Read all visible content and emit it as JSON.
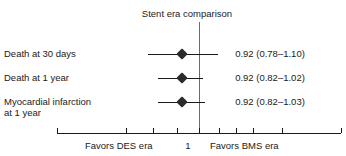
{
  "chart_data": {
    "type": "forest",
    "title": "Stent era comparison",
    "xlabel": "",
    "ylabel": "",
    "scale": "log",
    "null_value": 1,
    "null_label": "1",
    "grid": false,
    "legend": "none",
    "xlim": [
      0.5,
      2.0
    ],
    "left_caption": "Favors DES era",
    "right_caption": "Favors BMS era",
    "tick_values": [
      0.5,
      0.7,
      0.8,
      0.9,
      1.0,
      1.1,
      1.2,
      1.3,
      1.5,
      2.0
    ],
    "categories": [
      "Death at 30 days",
      "Death at 1 year",
      "Myocardial infarction at 1 year"
    ],
    "rows": [
      {
        "label": "Death at 30 days",
        "estimate": 0.92,
        "ci_low": 0.78,
        "ci_high": 1.1,
        "estimate_text": "0.92 (0.78–1.10)"
      },
      {
        "label": "Death at 1 year",
        "estimate": 0.92,
        "ci_low": 0.82,
        "ci_high": 1.02,
        "estimate_text": "0.92 (0.82–1.02)"
      },
      {
        "label": "Myocardial infarction\nat 1 year",
        "estimate": 0.92,
        "ci_low": 0.82,
        "ci_high": 1.03,
        "estimate_text": "0.92 (0.82–1.03)"
      }
    ],
    "colors": {
      "marker": "#2a2a2a",
      "ci_line": "#1a1a1a",
      "null_line": "#6b6b6b",
      "axis": "#1a1a1a",
      "text": "#1a1a1a",
      "background": "#ffffff"
    }
  }
}
